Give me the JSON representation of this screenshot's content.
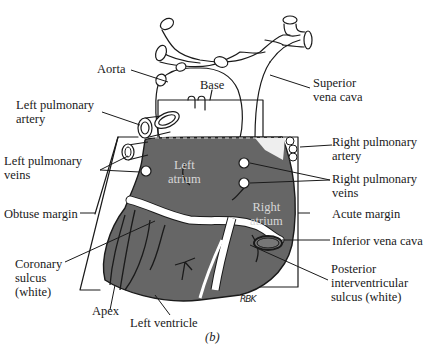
{
  "figure": {
    "caption": "(b)",
    "signature": "RBK",
    "colors": {
      "heart_fill": "#666666",
      "outline": "#1a1a1a",
      "sulcus_white": "#ffffff",
      "background": "#ffffff"
    }
  },
  "labels": {
    "aorta": "Aorta",
    "base": "Base",
    "superior_vena_cava": "Superior\nvena cava",
    "left_pulmonary_artery": "Left pulmonary\nartery",
    "right_pulmonary_artery": "Right pulmonary\nartery",
    "left_pulmonary_veins": "Left pulmonary\nveins",
    "right_pulmonary_veins": "Right pulmonary\nveins",
    "left_atrium": "Left\natrium",
    "right_atrium": "Right\natrium",
    "obtuse_margin": "Obtuse margin",
    "acute_margin": "Acute margin",
    "inferior_vena_cava": "Inferior vena cava",
    "coronary_sulcus": "Coronary\nsulcus\n(white)",
    "posterior_interventricular_sulcus": "Posterior\ninterventricular\nsulcus (white)",
    "apex": "Apex",
    "left_ventricle": "Left ventricle"
  }
}
